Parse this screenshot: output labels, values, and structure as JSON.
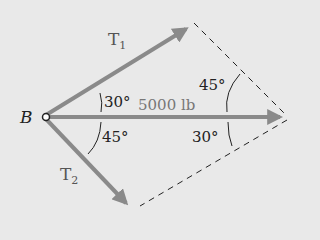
{
  "diagram": {
    "point_label": "B",
    "forces": [
      {
        "name": "T1",
        "label_main": "T",
        "label_sub": "1"
      },
      {
        "name": "T2",
        "label_main": "T",
        "label_sub": "2"
      },
      {
        "name": "resultant",
        "label": "5000 lb"
      }
    ],
    "angles": {
      "t1_at_b": "30°",
      "t2_at_b": "45°",
      "upper_right": "45°",
      "lower_right": "30°"
    },
    "colors": {
      "background": "#e9e9e9",
      "arrow": "#8a8a8a",
      "dashed": "#222222",
      "text": "#222222"
    }
  }
}
